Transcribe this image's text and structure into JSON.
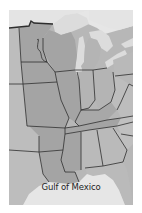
{
  "map": {
    "region": "Central and Eastern United States",
    "labels": {
      "gulf": "Gulf of Mexico"
    },
    "colors": {
      "background": "#ffffff",
      "water": "#e6e6e6",
      "land_light": "#b9b9b9",
      "land_mid": "#a8a8a8",
      "land_dark": "#9a9a9a",
      "borders": "#2e2e2e",
      "lake": "#dcdcdc"
    },
    "features": [
      "great-lakes",
      "mississippi-river-states",
      "state-borders",
      "gulf-coast",
      "florida-peninsula"
    ]
  }
}
